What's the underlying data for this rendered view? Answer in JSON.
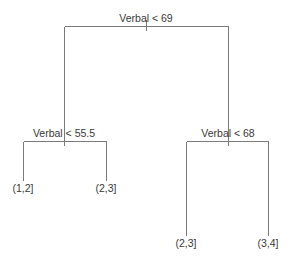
{
  "diagram": {
    "type": "decision-tree",
    "stroke_color": "#7a7a7a",
    "text_color": "#3a3a3a",
    "root": {
      "split": "Verbal < 69",
      "left": {
        "split": "Verbal < 55.5",
        "left": {
          "leaf": "(1,2]"
        },
        "right": {
          "leaf": "(2,3]"
        }
      },
      "right": {
        "split": "Verbal < 68",
        "left": {
          "leaf": "(2,3]"
        },
        "right": {
          "leaf": "(3,4]"
        }
      }
    }
  }
}
